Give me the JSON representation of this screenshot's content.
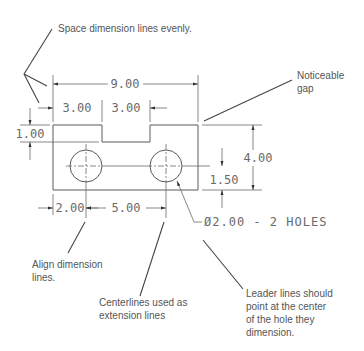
{
  "notes": {
    "space_evenly": "Space dimension lines evenly.",
    "noticeable_gap_1": "Noticeable",
    "noticeable_gap_2": "gap",
    "align_1": "Align dimension",
    "align_2": "lines.",
    "centerlines_1": "Centerlines used as",
    "centerlines_2": "extension lines",
    "leader_1": "Leader lines should",
    "leader_2": "point at the center",
    "leader_3": "of the hole they",
    "leader_4": "dimension."
  },
  "dimensions": {
    "overall_width": "9.00",
    "left_shoulder": "3.00",
    "notch_width": "3.00",
    "notch_depth": "1.00",
    "overall_height": "4.00",
    "hole_height": "1.50",
    "hole_edge_offset": "2.00",
    "hole_spacing": "5.00"
  },
  "callout": {
    "hole_spec": "Ø2.00 - 2 HOLES"
  }
}
